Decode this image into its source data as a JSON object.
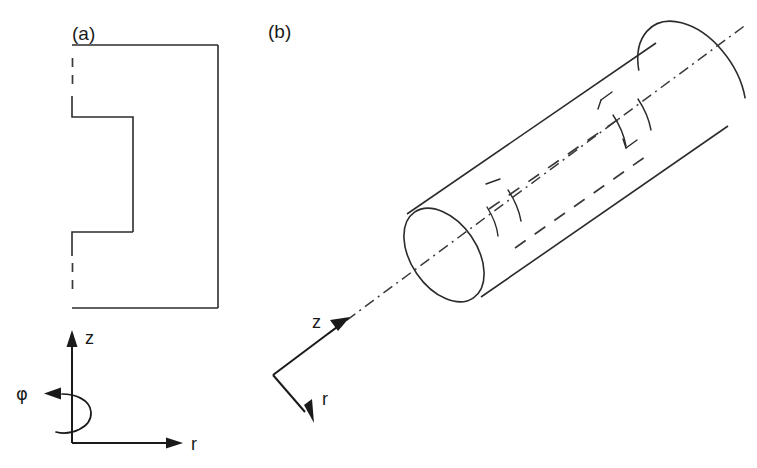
{
  "figure": {
    "panels": [
      {
        "id": "panel-a",
        "label": "(a)",
        "description": "2D axial cross-section of a hollow cylinder in cylindrical coordinates",
        "axes": {
          "vertical_label": "z",
          "horizontal_label": "r",
          "rotation_label": "φ"
        }
      },
      {
        "id": "panel-b",
        "label": "(b)",
        "description": "3D perspective view of the cylinder with hidden internal cavity",
        "axes": {
          "axial_label": "z",
          "radial_label": "r"
        }
      }
    ],
    "colors": {
      "line": "#2b2b2b",
      "hidden_line": "#3a3a3a",
      "axis": "#1a1a1a",
      "background": "#ffffff"
    }
  }
}
